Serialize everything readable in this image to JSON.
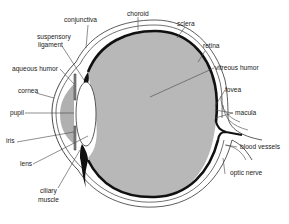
{
  "diagram": {
    "type": "anatomy-cross-section",
    "colors": {
      "background": "#ffffff",
      "vitreous_fill": "#b8b8b8",
      "aqueous_fill": "#b0b0b0",
      "lens_fill": "#ffffff",
      "choroid": "#111111",
      "outline": "#333333",
      "label_text": "#222222",
      "leader_line": "#444444"
    },
    "labels": {
      "conjunctiva": "conjunctiva",
      "choroid": "choroid",
      "sclera": "sclera",
      "suspensory_ligament_1": "suspensory",
      "suspensory_ligament_2": "ligament",
      "retina": "retina",
      "aqueous_humor": "aqueous humor",
      "vitreous_humor": "vitreous humor",
      "cornea": "cornea",
      "fovea": "fovea",
      "macula": "macula",
      "pupil": "pupil",
      "iris": "iris",
      "blood_vessels": "blood vessels",
      "lens": "lens",
      "optic_nerve": "optic nerve",
      "ciliary_muscle_1": "ciliary",
      "ciliary_muscle_2": "muscle"
    }
  }
}
